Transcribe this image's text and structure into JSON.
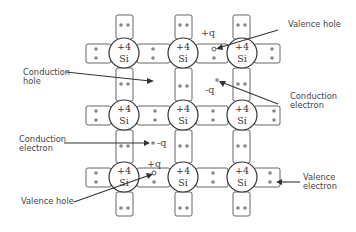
{
  "diagram": {
    "atom": {
      "charge_label": "+4",
      "symbol": "Si"
    },
    "grid": {
      "columns_x": [
        124,
        183,
        241
      ],
      "rows_y": [
        53,
        115,
        177
      ],
      "radius": 15
    },
    "labels": {
      "valence_hole_top": "Valence hole",
      "conduction_hole_line1": "Conduction",
      "conduction_hole_line2": "hole",
      "conduction_electron_right_line1": "Conduction",
      "conduction_electron_right_line2": "electron",
      "conduction_electron_left_line1": "Conduction",
      "conduction_electron_left_line2": "electron",
      "valence_hole_bottom": "Valence hole",
      "valence_electron_line1": "Valence",
      "valence_electron_line2": "electron"
    },
    "charges": {
      "plus_top": "+q",
      "minus_center": "-q",
      "minus_left": "-q",
      "plus_bottom": "+q"
    }
  }
}
